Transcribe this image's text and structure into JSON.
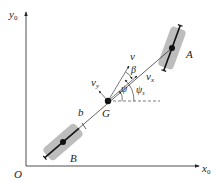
{
  "axes": {
    "y_label": "y",
    "y_sub": "0",
    "x_label": "x",
    "x_sub": "0",
    "origin_label": "O"
  },
  "points": {
    "A": "A",
    "B": "B",
    "G": "G"
  },
  "dimensions": {
    "b": "b"
  },
  "vectors": {
    "v": "v",
    "vx": "v",
    "vx_sub": "x",
    "vy": "v",
    "vy_sub": "y"
  },
  "angles": {
    "beta": "β",
    "psi": "ψ",
    "psi_s": "ψ",
    "psi_s_sub": "s"
  },
  "colors": {
    "line": "#222222",
    "wheel_fill": "#bdbdbd",
    "background": "#ffffff"
  }
}
